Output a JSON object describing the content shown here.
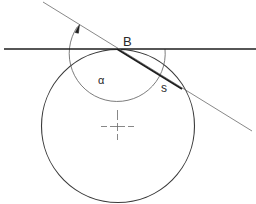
{
  "diagram": {
    "colors": {
      "background": "#ffffff",
      "stroke_dark": "#1e1e1e",
      "stroke_mid": "#3a3a3a",
      "stroke_light": "#6a6a6a"
    },
    "labels": {
      "point_b": "B",
      "chord": "s",
      "angle": "α"
    },
    "geometry": {
      "tangent_line": {
        "x1": 4,
        "y1": 49,
        "x2": 256,
        "y2": 49
      },
      "secant_line": {
        "x1": 43,
        "y1": 2,
        "x2": 252,
        "y2": 131
      },
      "circle": {
        "cx": 118,
        "cy": 126,
        "r": 76
      },
      "chord": {
        "x1": 117,
        "y1": 49,
        "x2": 182,
        "y2": 89
      },
      "angle_arc": {
        "cx": 117,
        "cy": 49,
        "r": 48
      },
      "center_mark": {
        "cx": 118,
        "cy": 127
      }
    },
    "elements": [
      "horizontal tangent line through B",
      "secant line through B",
      "main circle",
      "thick chord s from B",
      "angle arc alpha with arrowhead",
      "dashed center crosshair"
    ]
  }
}
